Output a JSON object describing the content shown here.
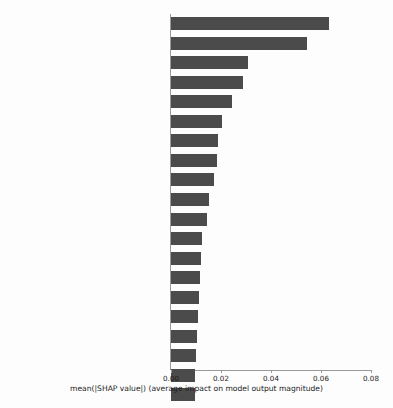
{
  "chart_data": {
    "type": "bar",
    "orientation": "horizontal",
    "title": "",
    "xlabel": "mean(|SHAP value|) (average impact on model output magnitude)",
    "ylabel": "",
    "xlim": [
      0,
      0.0855
    ],
    "xticks": [
      0.0,
      0.02,
      0.04,
      0.06,
      0.08
    ],
    "xtick_labels": [
      "0.00",
      "0.02",
      "0.04",
      "0.06",
      "0.08"
    ],
    "grid": false,
    "legend": false,
    "bar_color": "#4b4b4b",
    "background_color": "#fdfdfd",
    "categories": [
      "SEND_SMS",
      "READ_PHONE_STATE",
      "RECEIVE",
      "READ_EXTERNAL_STORAGE",
      "ACCESS_NETWORK_STATE",
      "READ_SMS",
      "RECEIVE_BOOT_COMPLETED",
      "BILLING",
      "INSTALL_PACKAGES",
      "WRITE_SMS",
      "WAKE_LOCK",
      "WRITE_EXTERNAL_STORAGE",
      "C2D_MESSAGE",
      "GET_ACCOUNTS",
      "CHANGE_WIFI_STATE",
      "GET_TASKS",
      "ACCESS_LOCATION_EXTRA_COMMANDS",
      "WRITE_SETTINGS",
      "CAMERA",
      "BIND_GET_INSTALL_REFERRER_SERVICE"
    ],
    "values": [
      0.0632,
      0.0544,
      0.0308,
      0.0288,
      0.0244,
      0.0204,
      0.0188,
      0.0184,
      0.0172,
      0.0152,
      0.0144,
      0.0124,
      0.012,
      0.0116,
      0.0112,
      0.0108,
      0.0104,
      0.01,
      0.0096,
      0.0096
    ]
  }
}
